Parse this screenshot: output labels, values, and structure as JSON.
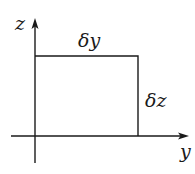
{
  "diagram": {
    "axes": {
      "vertical_label": "z",
      "horizontal_label": "y"
    },
    "rectangle": {
      "top_label": "δy",
      "right_label": "δz"
    },
    "colors": {
      "stroke": "#1a1a1a",
      "background": "#ffffff"
    }
  }
}
